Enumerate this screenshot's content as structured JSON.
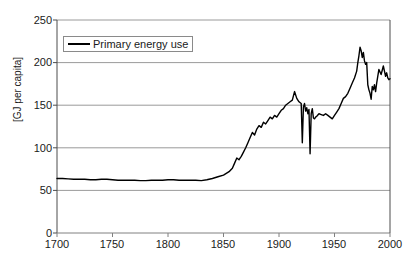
{
  "chart_data": {
    "type": "line",
    "title": "",
    "xlabel": "",
    "ylabel": "[GJ per capita]",
    "xlim": [
      1700,
      2000
    ],
    "ylim": [
      0,
      250
    ],
    "ytick_values": [
      0,
      50,
      100,
      150,
      200,
      250
    ],
    "ytick_labels": [
      "0",
      "50",
      "100",
      "150",
      "200",
      "250"
    ],
    "xtick_values": [
      1700,
      1750,
      1800,
      1850,
      1900,
      1950,
      2000
    ],
    "xtick_labels": [
      "1700",
      "1750",
      "1800",
      "1850",
      "1900",
      "1950",
      "2000"
    ],
    "grid": "horizontal",
    "grid_color": "#808080",
    "line_color": "#000000",
    "background": "#ffffff",
    "legend": {
      "position": "top-left-inside",
      "entries": [
        {
          "name": "Primary energy use",
          "color": "#000000",
          "marker": "line"
        }
      ]
    },
    "series": [
      {
        "name": "Primary energy use",
        "x": [
          1700,
          1705,
          1710,
          1715,
          1720,
          1725,
          1730,
          1735,
          1740,
          1745,
          1750,
          1755,
          1760,
          1765,
          1770,
          1775,
          1780,
          1785,
          1790,
          1795,
          1800,
          1805,
          1810,
          1815,
          1820,
          1825,
          1830,
          1835,
          1840,
          1845,
          1850,
          1855,
          1858,
          1860,
          1862,
          1864,
          1866,
          1868,
          1870,
          1872,
          1874,
          1876,
          1878,
          1880,
          1882,
          1884,
          1886,
          1888,
          1890,
          1892,
          1894,
          1896,
          1898,
          1900,
          1902,
          1904,
          1906,
          1908,
          1910,
          1912,
          1914,
          1916,
          1918,
          1920,
          1921,
          1922,
          1923,
          1924,
          1925,
          1926,
          1927,
          1928,
          1929,
          1930,
          1931,
          1932,
          1933,
          1934,
          1936,
          1938,
          1940,
          1942,
          1944,
          1946,
          1948,
          1950,
          1952,
          1954,
          1956,
          1958,
          1960,
          1962,
          1964,
          1966,
          1968,
          1970,
          1971,
          1972,
          1973,
          1974,
          1975,
          1976,
          1977,
          1978,
          1979,
          1980,
          1981,
          1982,
          1983,
          1984,
          1985,
          1986,
          1987,
          1988,
          1990,
          1992,
          1994,
          1995,
          1996,
          1997,
          1998,
          1999,
          2000
        ],
        "y": [
          64,
          64,
          63.5,
          63,
          63,
          63,
          62.5,
          62.5,
          63,
          63,
          62.5,
          62,
          62,
          62,
          62,
          61.5,
          61.5,
          62,
          62,
          62,
          62.5,
          62.5,
          62,
          62,
          62,
          62,
          61.5,
          62.5,
          64,
          66,
          68,
          72,
          76,
          82,
          88,
          86,
          90,
          95,
          100,
          106,
          112,
          118,
          115,
          122,
          126,
          124,
          130,
          128,
          132,
          136,
          134,
          138,
          136,
          140,
          144,
          146,
          150,
          152,
          154,
          156,
          166,
          158,
          154,
          152,
          106,
          148,
          152,
          143,
          147,
          140,
          145,
          93,
          140,
          146,
          135,
          134,
          136,
          137,
          140,
          139,
          138,
          140,
          138,
          136,
          134,
          138,
          142,
          146,
          152,
          158,
          160,
          164,
          170,
          176,
          182,
          190,
          200,
          208,
          218,
          214,
          206,
          212,
          202,
          198,
          200,
          174,
          168,
          164,
          157,
          172,
          168,
          174,
          166,
          176,
          192,
          186,
          196,
          190,
          184,
          188,
          182,
          180,
          181
        ]
      }
    ]
  },
  "axis": {
    "y_title": "[GJ per capita]"
  }
}
